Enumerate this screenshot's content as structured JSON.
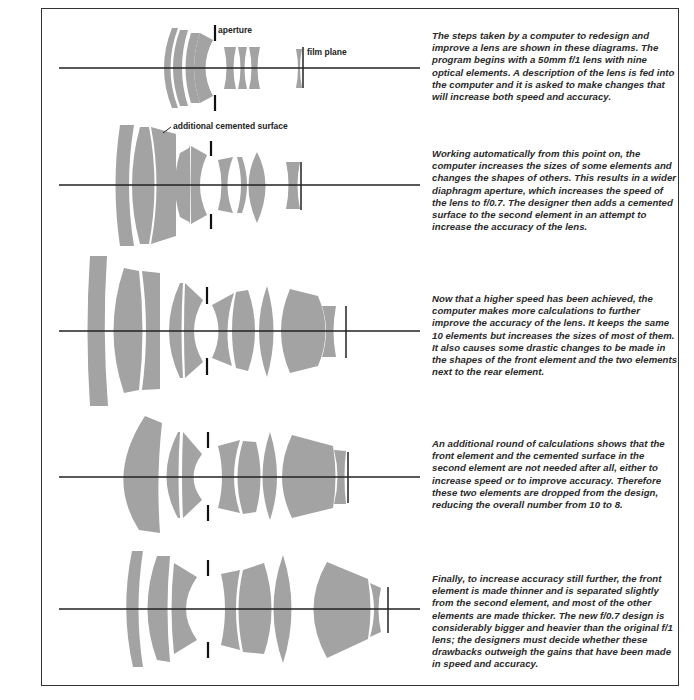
{
  "figure": {
    "lens_fill_color": "#a3a3a3",
    "axis_color": "#222222",
    "labels": {
      "aperture": "aperture",
      "film_plane": "film plane",
      "cemented_surface": "additional cemented surface"
    },
    "steps": [
      {
        "step": 1,
        "element_count": 9,
        "speed": "f/1",
        "caption": "The steps taken by a computer to redesign and improve a lens are shown in these diagrams. The program begins with a 50mm f/1 lens with nine optical elements. A description of the lens is fed into the computer and it is asked to make changes that will increase both speed and accuracy."
      },
      {
        "step": 2,
        "element_count": 10,
        "speed": "f/0.7",
        "caption": "Working automatically from this point on, the computer increases the sizes of some elements and changes the shapes of others. This results in a wider diaphragm aperture, which increases the speed of the lens to f/0.7. The designer then adds a cemented surface to the second element in an attempt to increase the accuracy of the lens."
      },
      {
        "step": 3,
        "element_count": 10,
        "caption": "Now that a higher speed has been achieved, the computer makes more calculations to further improve the accuracy of the lens. It keeps the same 10 elements but increases the sizes of most of them. It also causes some drastic changes to be made in the shapes of the front element and the two elements next to the rear element."
      },
      {
        "step": 4,
        "element_count": 8,
        "caption": "An additional round of calculations shows that the front element and the cemented surface in the second element are not needed after all, either to increase speed or to improve accuracy. Therefore these two elements are dropped from the design, reducing the overall number from 10 to 8."
      },
      {
        "step": 5,
        "element_count": 9,
        "speed": "f/0.7",
        "caption": "Finally, to increase accuracy still further, the front element is made thinner and is separated slightly from the second element, and most of the other elements are made thicker. The new f/0.7 design is considerably bigger and heavier than the original f/1 lens; the designers must decide whether these drawbacks outweigh the gains that have been made in speed and accuracy."
      }
    ]
  }
}
